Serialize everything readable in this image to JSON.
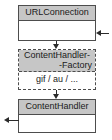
{
  "diagram": {
    "background_color": "#ffffff",
    "header_fill_color": "#c6c6c6",
    "body_fill_color": "#ffffff",
    "line_color": "#4d4d4d",
    "arrow_color": "#2b2b2b"
  },
  "boxes": {
    "urlconnection": {
      "name": "URLConnection",
      "border_style": "solid",
      "body_text": ""
    },
    "factory": {
      "name_line1": "ContentHandler-",
      "name_line2": "-Factory",
      "border_style": "dashed",
      "body_text": "gif / au / ..."
    },
    "contenthandler": {
      "name": "ContentHandler",
      "border_style": "solid",
      "body_text": ""
    }
  },
  "connectors": {
    "url_to_factory": {
      "label": "",
      "direction": "down"
    },
    "factory_to_handler": {
      "label": "",
      "direction": "down"
    },
    "right_incoming": {
      "label": "",
      "direction": "left"
    },
    "left_outgoing": {
      "label": "",
      "direction": "left"
    }
  }
}
